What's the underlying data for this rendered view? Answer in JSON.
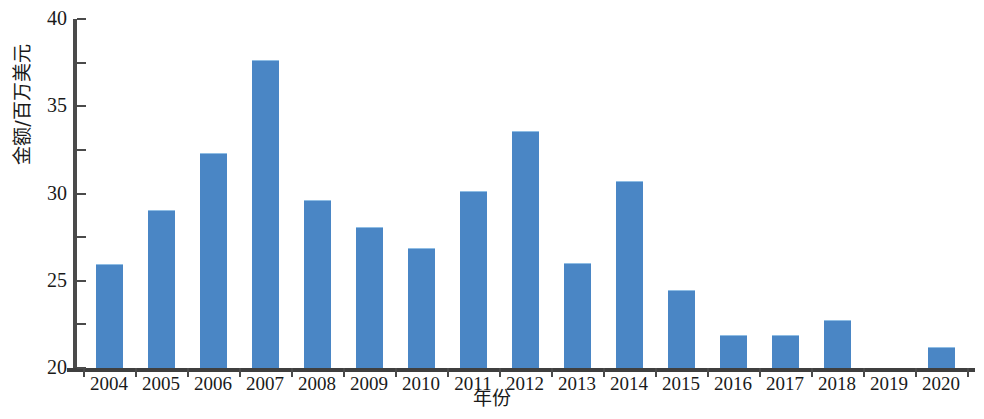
{
  "chart_data": {
    "type": "bar",
    "title": "",
    "subtitle": "",
    "xlabel": "年份",
    "ylabel": "金额/百万美元",
    "categories": [
      "2004",
      "2005",
      "2006",
      "2007",
      "2008",
      "2009",
      "2010",
      "2011",
      "2012",
      "2013",
      "2014",
      "2015",
      "2016",
      "2017",
      "2018",
      "2019",
      "2020"
    ],
    "values": [
      11.8,
      18.0,
      24.5,
      35.2,
      19.1,
      16.1,
      13.6,
      20.2,
      27.0,
      11.9,
      21.3,
      8.8,
      3.7,
      3.7,
      5.4,
      0,
      2.3
    ],
    "series": [
      {
        "name": "金额",
        "values": [
          11.8,
          18.0,
          24.5,
          35.2,
          19.1,
          16.1,
          13.6,
          20.2,
          27.0,
          11.9,
          21.3,
          8.8,
          3.7,
          3.7,
          5.4,
          0,
          2.3
        ]
      }
    ],
    "ylim": [
      0,
      40
    ],
    "y_ticks": [
      0,
      5,
      10,
      15,
      20,
      25,
      30,
      35,
      40
    ],
    "y_tick_labels": [
      "0",
      "5",
      "10",
      "15",
      "20",
      "25",
      "30",
      "35",
      "40"
    ],
    "grid": false,
    "legend": null,
    "bar_color": "#4a86c5",
    "axis_color": "#4a4a4a",
    "background": "#ffffff"
  }
}
